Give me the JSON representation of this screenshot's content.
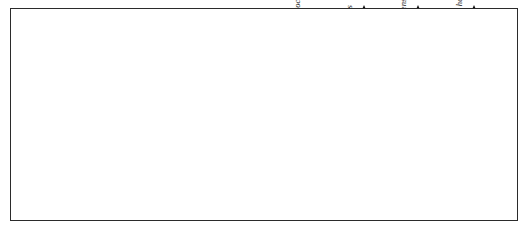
{
  "stage": {
    "chinese": "艾菲尔期",
    "english": "Eifelian"
  },
  "subdivision_labels": {
    "late": "晚",
    "early": "早"
  },
  "zones": [
    {
      "id": "ensensis",
      "name": "ensensis",
      "suffix": "带",
      "top": 0,
      "height": 54,
      "subdivided": true
    },
    {
      "id": "kockelianus",
      "name": "kockelianus",
      "suffix": "带",
      "top": 54,
      "height": 54,
      "subdivided": true
    },
    {
      "id": "australis",
      "name": "australis",
      "suffix": "带",
      "top": 108,
      "height": 35,
      "subdivided": false
    },
    {
      "id": "costatus",
      "name": "costatus",
      "suffix": "带",
      "top": 143,
      "height": 35,
      "subdivided": false
    },
    {
      "id": "partitus",
      "name": "partitus",
      "suffix": "带",
      "top": 178,
      "height": 35,
      "subdivided": false
    }
  ],
  "chart_data": {
    "type": "range-chart",
    "xlabel": "",
    "ylabel": "",
    "grid": true,
    "zone_boundaries_px": [
      0,
      27,
      54,
      81,
      108,
      143,
      178,
      213
    ],
    "taxa": [
      {
        "name": "Po. costatus partitus",
        "x": 4,
        "bar_top": 118,
        "bar_bottom": 213,
        "arrow": false,
        "label_y": 120,
        "fossil_cx": 24,
        "fossil_cy": 92,
        "fossil_type": "blade-leaf",
        "fossil_rot": -8
      },
      {
        "name": "Po. costatus costatus",
        "x": 56,
        "bar_top": 105,
        "bar_bottom": 213,
        "arrow": false,
        "label_y": 112,
        "fossil_cx": 76,
        "fossil_cy": 72,
        "fossil_type": "blade-broad",
        "fossil_rot": -12
      },
      {
        "name": "T. kockelianus australis",
        "x": 112,
        "bar_top": 95,
        "bar_bottom": 213,
        "arrow": false,
        "label_y": 100,
        "fossil_cx": 132,
        "fossil_cy": 52,
        "fossil_type": "hook",
        "fossil_rot": 0
      },
      {
        "name": "T. kockelianus kockelianus",
        "x": 182,
        "bar_top": 72,
        "bar_bottom": 213,
        "arrow": false,
        "label_y": 12,
        "fossil_cx": 200,
        "fossil_cy": 122,
        "fossil_type": "flared",
        "fossil_rot": 0
      },
      {
        "name": "Po. eiflius",
        "x": 234,
        "bar_top": 6,
        "bar_bottom": 213,
        "arrow": true,
        "label_y": 32,
        "fossil_cx": 250,
        "fossil_cy": 96,
        "fossil_type": "blade-broad",
        "fossil_rot": 10
      },
      {
        "name": "Po. ensensis",
        "x": 288,
        "bar_top": 6,
        "bar_bottom": 165,
        "arrow": true,
        "label_y": 16,
        "fossil_cx": 302,
        "fossil_cy": 92,
        "fossil_type": "blade-leaf",
        "fossil_rot": 14
      },
      {
        "name": "Po. hemiansatus",
        "x": 344,
        "bar_top": 6,
        "bar_bottom": 120,
        "arrow": true,
        "label_y": 12,
        "fossil_cx": 358,
        "fossil_cy": 76,
        "fossil_type": "blade-leaf",
        "fossil_rot": 6
      }
    ]
  }
}
